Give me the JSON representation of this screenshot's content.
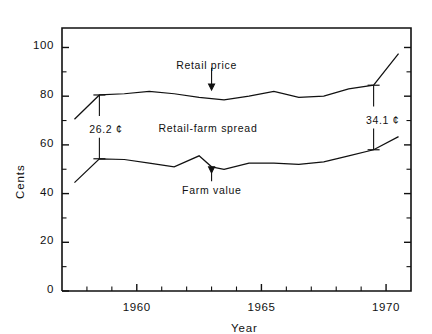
{
  "chart_data": {
    "type": "line",
    "title": "",
    "xlabel": "Year",
    "ylabel": "Cents",
    "xlim": [
      1957.0,
      1971.0
    ],
    "ylim": [
      0,
      108
    ],
    "grid": false,
    "legend_position": "none",
    "x_major_ticks": [
      1960,
      1965,
      1970
    ],
    "x_major_tick_labels": [
      "1960",
      "1965",
      "1970"
    ],
    "x_minor_ticks": [
      1958,
      1959,
      1961,
      1962,
      1963,
      1964,
      1966,
      1967,
      1968,
      1969
    ],
    "y_major_ticks": [
      0,
      20,
      40,
      60,
      80,
      100
    ],
    "y_major_tick_labels": [
      "0",
      "20",
      "40",
      "60",
      "80",
      "100"
    ],
    "y_minor_ticks": [
      10,
      30,
      50,
      70,
      90
    ],
    "x": [
      1957.5,
      1958.5,
      1959.5,
      1960.5,
      1961.5,
      1962.5,
      1963.0,
      1963.5,
      1964.5,
      1965.5,
      1966.5,
      1967.5,
      1968.5,
      1969.5,
      1970.5
    ],
    "series": [
      {
        "name": "Retail price",
        "values": [
          70.5,
          80.5,
          81.0,
          82.0,
          81.0,
          79.5,
          79.0,
          78.5,
          80.0,
          82.0,
          79.5,
          80.0,
          83.0,
          84.5,
          97.5
        ]
      },
      {
        "name": "Farm value",
        "values": [
          44.5,
          54.3,
          54.0,
          52.5,
          51.0,
          55.5,
          51.0,
          50.0,
          52.5,
          52.5,
          52.0,
          53.0,
          55.5,
          58.0,
          63.4
        ]
      }
    ],
    "annotations": [
      {
        "name": "retail-price-label",
        "text": "Retail price",
        "x": 1963.0,
        "y": 92.5
      },
      {
        "name": "retail-farm-spread-label",
        "text": "Retail-farm spread",
        "x": 1963.0,
        "y": 66.5
      },
      {
        "name": "farm-value-label",
        "text": "Farm value",
        "x": 1963.0,
        "y": 41.0
      },
      {
        "name": "spread-1958-value",
        "text": "26.2 ¢",
        "x": 1958.8,
        "y": 66.0
      },
      {
        "name": "spread-1969-value",
        "text": "34.1 ¢",
        "x": 1969.9,
        "y": 70.0
      }
    ],
    "spread_measures": [
      {
        "name": "spread-1958",
        "label": "26.2 ¢",
        "x": 1958.5,
        "y_top": 80.5,
        "y_bottom": 54.3,
        "value": 26.2
      },
      {
        "name": "spread-1969",
        "label": "34.1 ¢",
        "x": 1969.5,
        "y_top": 84.5,
        "y_bottom": 58.0,
        "value": 34.1
      }
    ]
  },
  "axes": {
    "ylabel": "Cents",
    "xlabel": "Year",
    "ytick_labels": [
      "100",
      "80",
      "60",
      "40",
      "20",
      "0"
    ],
    "xtick_labels": [
      "1960",
      "1965",
      "1970"
    ]
  },
  "labels": {
    "retail_price": "Retail price",
    "retail_farm_spread": "Retail-farm spread",
    "farm_value": "Farm value",
    "spread_left": "26.2 ¢",
    "spread_right": "34.1 ¢"
  },
  "colors": {
    "ink": "#111111",
    "background": "#ffffff"
  }
}
